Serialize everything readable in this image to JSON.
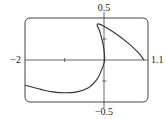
{
  "chart_data": {
    "type": "line",
    "title": "",
    "xlabel": "",
    "ylabel": "",
    "xlim": [
      -2,
      1.1
    ],
    "ylim": [
      -0.5,
      0.5
    ],
    "grid": false,
    "legend": null,
    "tick_labels": {
      "x_min": "−2",
      "x_max": "1.1",
      "y_max": "0.5",
      "y_min": "−0.5"
    },
    "x_ticks": [
      -1
    ],
    "y_ticks": [
      -0.25,
      0.25
    ],
    "series": [
      {
        "name": "parametric curve",
        "x": [
          -2.0,
          -1.6,
          -1.3,
          -1.0,
          -0.7,
          -0.4,
          -0.2,
          -0.08,
          0.0,
          0.0,
          -0.03,
          -0.08,
          -0.13,
          -0.18,
          -0.15,
          0.0,
          0.3,
          0.6,
          0.85,
          1.0
        ],
        "y": [
          -0.3,
          -0.35,
          -0.38,
          -0.39,
          -0.38,
          -0.33,
          -0.24,
          -0.13,
          -0.02,
          0.08,
          0.18,
          0.28,
          0.36,
          0.41,
          0.43,
          0.4,
          0.31,
          0.2,
          0.09,
          0.0
        ]
      }
    ]
  }
}
